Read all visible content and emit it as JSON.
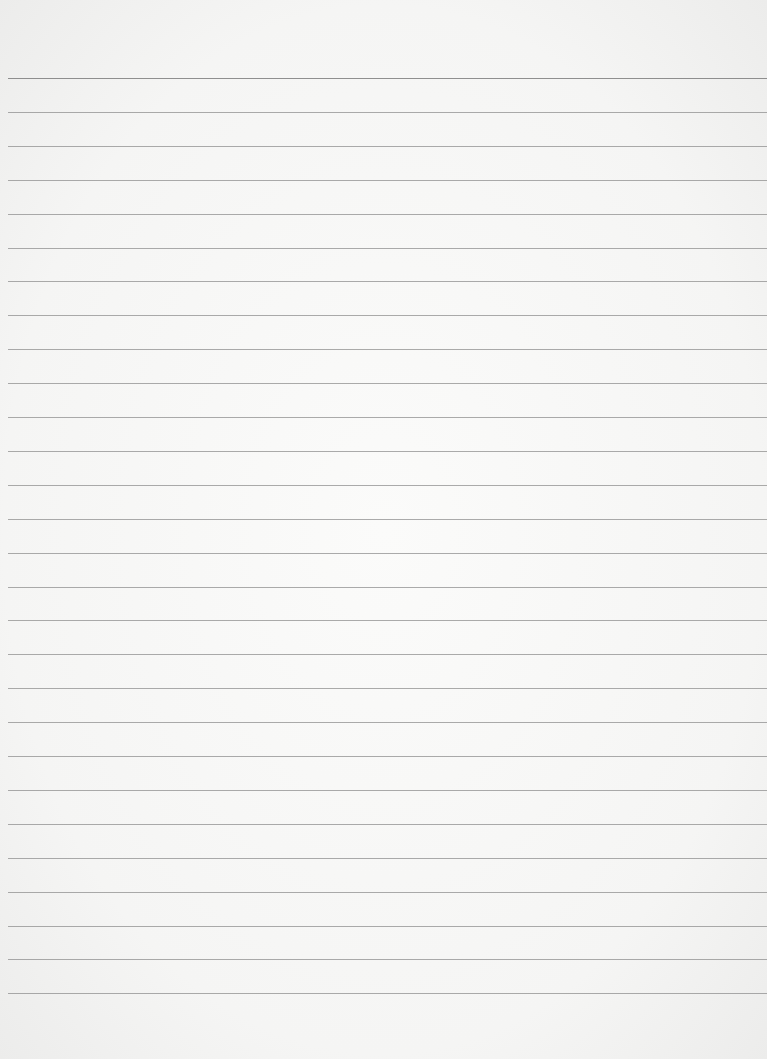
{
  "page": {
    "type": "blank-lined-paper",
    "colors": {
      "paper": "#f8f8f7",
      "rule": "#8f8f8f"
    },
    "rules": {
      "count": 28,
      "first_y": 78,
      "spacing": 33.9
    }
  }
}
